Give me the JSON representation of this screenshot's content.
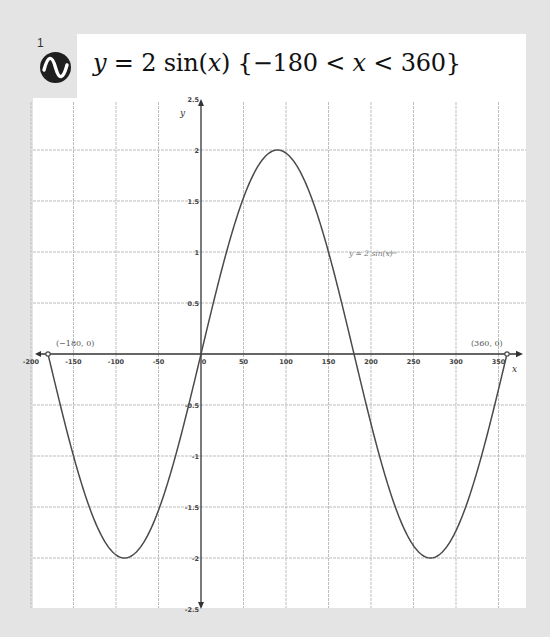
{
  "expression": {
    "index": "1",
    "icon": "sine-wave-icon",
    "title_parts": [
      "y",
      " = 2 sin(",
      "x",
      ")  {−180 < ",
      "x",
      " < 360}"
    ],
    "title_text": "y = 2 sin(x) {−180 < x < 360}"
  },
  "colors": {
    "background": "#e4e4e4",
    "panel": "#ffffff",
    "curve": "#4a4a4a",
    "axis": "#333333",
    "grid": "#bdbdbd",
    "icon_bg": "#1f1f1f"
  },
  "chart_data": {
    "type": "line",
    "title": "y = 2 sin(x) {−180 < x < 360}",
    "xlabel": "x",
    "ylabel": "y",
    "xlim": [
      -200,
      375
    ],
    "ylim": [
      -2.5,
      2.5
    ],
    "grid": true,
    "x_ticks": [
      -200,
      -150,
      -100,
      -50,
      0,
      50,
      100,
      150,
      200,
      250,
      300,
      350
    ],
    "x_tick_labels": [
      "-200",
      "-150",
      "-100",
      "-50",
      "0",
      "50",
      "100",
      "150",
      "200",
      "250",
      "300",
      "350"
    ],
    "y_ticks": [
      -2.5,
      -2,
      -1.5,
      -1,
      -0.5,
      0.5,
      1,
      1.5,
      2,
      2.5
    ],
    "y_tick_labels": [
      "-2.5",
      "-2",
      "-1.5",
      "-1",
      "-0.5",
      "0.5",
      "1",
      "1.5",
      "2",
      "2.5"
    ],
    "series": [
      {
        "name": "y = 2 sin(x)",
        "function": "2*sin(x degrees)",
        "domain": [
          -180,
          360
        ],
        "x": [
          -180,
          -150,
          -120,
          -90,
          -60,
          -30,
          0,
          30,
          60,
          90,
          120,
          150,
          180,
          210,
          240,
          270,
          300,
          330,
          360
        ],
        "values": [
          0,
          -1,
          -1.73,
          -2,
          -1.73,
          -1,
          0,
          1,
          1.73,
          2,
          1.73,
          1,
          0,
          -1,
          -1.73,
          -2,
          -1.73,
          -1,
          0
        ]
      }
    ],
    "annotations": [
      {
        "text": "(−180, 0)",
        "x": -180,
        "y": 0
      },
      {
        "text": "(360, 0)",
        "x": 360,
        "y": 0
      },
      {
        "text": "y = 2 sin(x)",
        "x": 175,
        "y": 1,
        "type": "curve-label"
      }
    ]
  }
}
